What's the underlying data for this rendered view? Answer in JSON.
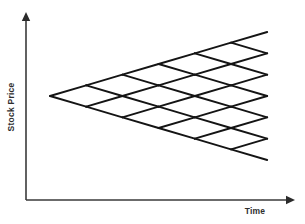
{
  "figure": {
    "background_color": "#ffffff",
    "line_color": "#141414",
    "axis_color": "#3a3a3a",
    "label_color": "#2e2e2e"
  },
  "axes": {
    "y": {
      "label": "Stock Price",
      "orientation": "vertical",
      "arrow": "up",
      "x": 26,
      "top": 12,
      "bottom": 200
    },
    "x": {
      "label": "Time",
      "orientation": "horizontal",
      "arrow": "right",
      "y": 200,
      "left": 26,
      "right": 295
    }
  },
  "chart_data": {
    "type": "line",
    "xlabel": "Time",
    "ylabel": "Stock Price",
    "grid": false,
    "legend": null,
    "lattice": {
      "steps": 6,
      "root": {
        "x": 50,
        "y": 96
      },
      "step_width": 36.2,
      "half_step_height": 10.67,
      "terminal_x": 267,
      "terminal_nodes": 7,
      "terminal_top_y": 32,
      "terminal_bottom_y": 160,
      "recombining": true,
      "node_radius": 0
    }
  }
}
